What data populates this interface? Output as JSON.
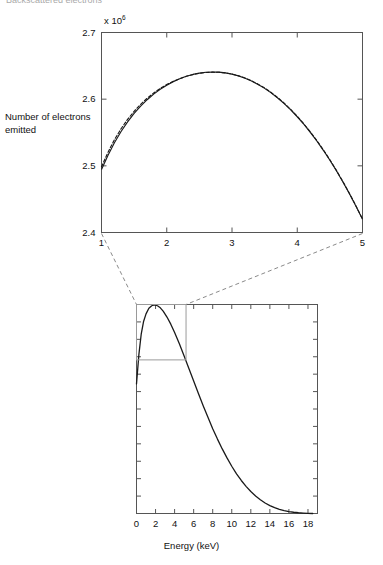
{
  "page": {
    "width": 383,
    "height": 565,
    "background": "#ffffff",
    "ink_color": "#111111",
    "axis_color": "#555555",
    "curve_color": "#1a1a1a",
    "connector_color": "#8a8a8a",
    "top_crop_remnant": "Backscattered electrons"
  },
  "chart_data": [
    {
      "id": "top-zoom-panel",
      "type": "line",
      "title": "",
      "subtitle": "",
      "xlabel": "",
      "ylabel": "Number of electrons emitted",
      "y_exponent_label": "x 10",
      "y_exponent_power": "6",
      "xlim": [
        1,
        5
      ],
      "ylim": [
        2.4,
        2.7
      ],
      "grid": false,
      "legend_position": "none",
      "xticks": [
        1,
        2,
        3,
        4,
        5
      ],
      "xticklabels": [
        "1",
        "2",
        "3",
        "4",
        "5"
      ],
      "yticks": [
        2.4,
        2.5,
        2.6,
        2.7
      ],
      "yticklabels": [
        "2.4",
        "2.5",
        "2.6",
        "2.7"
      ],
      "series": [
        {
          "name": "model",
          "style": "solid",
          "x": [
            1.0,
            1.1,
            1.2,
            1.3,
            1.4,
            1.5,
            1.6,
            1.7,
            1.8,
            1.9,
            2.0,
            2.1,
            2.2,
            2.3,
            2.4,
            2.5,
            2.6,
            2.7,
            2.8,
            2.9,
            3.0,
            3.1,
            3.2,
            3.3,
            3.4,
            3.5,
            3.6,
            3.7,
            3.8,
            3.9,
            4.0,
            4.1,
            4.2,
            4.3,
            4.4,
            4.5,
            4.6,
            4.7,
            4.8,
            4.9,
            5.0
          ],
          "y": [
            2.4945,
            2.516,
            2.535,
            2.5515,
            2.566,
            2.5786,
            2.5896,
            2.5992,
            2.6076,
            2.6148,
            2.621,
            2.6263,
            2.6307,
            2.6343,
            2.6371,
            2.6391,
            2.6403,
            2.6408,
            2.6405,
            2.6394,
            2.6376,
            2.6349,
            2.6315,
            2.6272,
            2.6221,
            2.6162,
            2.6094,
            2.6018,
            2.5933,
            2.5839,
            2.5736,
            2.5624,
            2.5503,
            2.5373,
            2.5233,
            2.5084,
            2.4926,
            2.4758,
            2.4581,
            2.4394,
            2.4198
          ]
        },
        {
          "name": "measured",
          "style": "dashed",
          "x": [
            1.0,
            1.1,
            1.2,
            1.3,
            1.4,
            1.5,
            1.6,
            1.7,
            1.8,
            1.9,
            2.0,
            2.1,
            2.2,
            2.3,
            2.4,
            2.5,
            2.6,
            2.7,
            2.8,
            2.9,
            3.0,
            3.1,
            3.2,
            3.3,
            3.4,
            3.5,
            3.6,
            3.7,
            3.8,
            3.9,
            4.0,
            4.1,
            4.2,
            4.3,
            4.4,
            4.5,
            4.6,
            4.7,
            4.8,
            4.9,
            5.0
          ],
          "y": [
            2.4985,
            2.5205,
            2.5395,
            2.5557,
            2.5697,
            2.5818,
            2.5923,
            2.6014,
            2.6093,
            2.6161,
            2.6219,
            2.6268,
            2.6309,
            2.6343,
            2.6369,
            2.6388,
            2.64,
            2.6405,
            2.6403,
            2.6393,
            2.6376,
            2.635,
            2.6317,
            2.6275,
            2.6225,
            2.6167,
            2.61,
            2.6024,
            2.594,
            2.5846,
            2.5743,
            2.5631,
            2.551,
            2.538,
            2.524,
            2.5091,
            2.4932,
            2.4764,
            2.4586,
            2.4399,
            2.4202
          ]
        }
      ]
    },
    {
      "id": "bottom-overview-panel",
      "type": "line",
      "title": "",
      "xlabel": "Energy (keV)",
      "ylabel": "",
      "xlim": [
        0,
        19
      ],
      "ylim": [
        0,
        1
      ],
      "grid": false,
      "legend_position": "none",
      "xticks": [
        0,
        2,
        4,
        6,
        8,
        10,
        12,
        14,
        16,
        18
      ],
      "xticklabels": [
        "0",
        "2",
        "4",
        "6",
        "8",
        "10",
        "12",
        "14",
        "16",
        "18"
      ],
      "yticks": [],
      "yticklabels": [],
      "inset_box": {
        "x0": 0.0,
        "x1": 5.2,
        "y0": 0.735,
        "y1": 1.0
      },
      "series": [
        {
          "name": "spectrum",
          "style": "solid",
          "x": [
            0.0,
            0.25,
            0.5,
            0.75,
            1.0,
            1.3,
            1.6,
            1.9,
            2.2,
            2.5,
            2.8,
            3.2,
            3.6,
            4.0,
            4.5,
            5.0,
            5.5,
            6.0,
            6.5,
            7.0,
            7.5,
            8.0,
            8.5,
            9.0,
            9.5,
            10.0,
            10.5,
            11.0,
            11.5,
            12.0,
            12.5,
            13.0,
            13.5,
            14.0,
            14.5,
            15.0,
            15.5,
            16.0,
            16.5,
            17.0,
            17.5,
            18.0,
            18.5
          ],
          "y": [
            0.62,
            0.76,
            0.86,
            0.92,
            0.955,
            0.982,
            0.994,
            0.998,
            0.994,
            0.984,
            0.968,
            0.94,
            0.906,
            0.866,
            0.812,
            0.754,
            0.694,
            0.634,
            0.574,
            0.516,
            0.46,
            0.406,
            0.356,
            0.309,
            0.266,
            0.226,
            0.19,
            0.158,
            0.13,
            0.105,
            0.084,
            0.066,
            0.05,
            0.038,
            0.028,
            0.02,
            0.014,
            0.009,
            0.006,
            0.0035,
            0.0018,
            0.0006,
            0.0
          ]
        }
      ]
    }
  ],
  "connectors": [
    {
      "name": "left-connector",
      "from": "top-panel-bottom-left",
      "to": "inset-box-top-left",
      "style": "dashed"
    },
    {
      "name": "right-connector",
      "from": "top-panel-bottom-right",
      "to": "inset-box-top-right",
      "style": "dashed"
    }
  ]
}
